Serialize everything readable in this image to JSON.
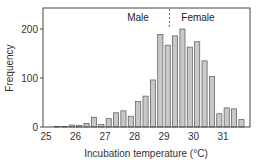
{
  "chart_data": {
    "type": "bar",
    "title": "",
    "xlabel": "Incubation temperature (°C)",
    "ylabel": "Frequency",
    "ylim": [
      0,
      240
    ],
    "xlim": [
      24.9,
      31.8
    ],
    "yticks": [
      0,
      100,
      200
    ],
    "xticks": [
      25,
      26,
      27,
      28,
      29,
      30,
      31
    ],
    "grid": false,
    "legend": null,
    "bin_width": 0.25,
    "x": [
      25.0,
      25.25,
      25.5,
      25.75,
      26.0,
      26.25,
      26.5,
      26.75,
      27.0,
      27.25,
      27.5,
      27.75,
      28.0,
      28.25,
      28.5,
      28.75,
      29.0,
      29.25,
      29.5,
      29.75,
      30.0,
      30.25,
      30.5,
      30.75,
      31.0,
      31.25,
      31.5
    ],
    "values": [
      0,
      1,
      1,
      4,
      3,
      7,
      20,
      5,
      17,
      29,
      33,
      22,
      52,
      63,
      96,
      189,
      167,
      186,
      200,
      163,
      174,
      135,
      103,
      27,
      39,
      37,
      15
    ],
    "annotations": [
      {
        "type": "vline",
        "x": 29.15,
        "style": "dashed"
      },
      {
        "type": "text",
        "text": "Male",
        "x": 28.4,
        "y": 210
      },
      {
        "type": "text",
        "text": "Female",
        "x": 29.9,
        "y": 210
      }
    ],
    "colors": {
      "bar_fill": "#c8c8c8",
      "bar_edge": "#555555",
      "axis": "#444444"
    }
  }
}
